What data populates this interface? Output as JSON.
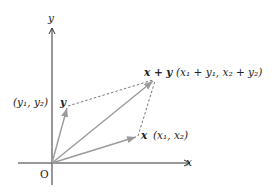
{
  "diagram": {
    "axes": {
      "x_label": "x",
      "y_label": "y",
      "origin_label": "O"
    },
    "vectors": [
      {
        "name": "x",
        "label": "x",
        "coord_label": "(x₁, x₂)"
      },
      {
        "name": "y",
        "label": "y",
        "coord_label": "(y₁, y₂)"
      },
      {
        "name": "x+y",
        "label": "x + y",
        "coord_label": "(x₁ + y₁, x₂ + y₂)"
      }
    ],
    "colors": {
      "axis": "#333333",
      "vector": "#9a9a9a",
      "dashed": "#555555"
    }
  }
}
